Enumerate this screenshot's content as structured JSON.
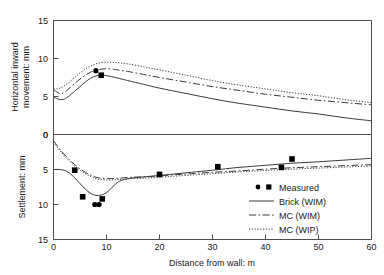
{
  "chart_data": {
    "type": "line",
    "title": "",
    "xlabel": "Distance from wall: m",
    "xlim": [
      0,
      60
    ],
    "xticks": [
      0,
      10,
      20,
      30,
      40,
      50,
      60
    ],
    "grid": false,
    "legend_position": "inside-bottom-right",
    "panels": [
      {
        "id": "top",
        "ylabel": "Horizontal inward movement: mm",
        "ylim": [
          0,
          15
        ],
        "yticks": [
          0,
          5,
          10,
          15
        ],
        "y_inverted": false,
        "series": [
          {
            "name": "Brick (WIM)",
            "style": "solid",
            "x": [
              0,
              0.6,
              1.2,
              2.0,
              3.0,
              4.0,
              5.0,
              6.0,
              7.0,
              8.0,
              9.0,
              10.0,
              11.0,
              12.0,
              14.0,
              17.0,
              20.0,
              25.0,
              30.0,
              35.0,
              40.0,
              45.0,
              50.0,
              55.0,
              60.0
            ],
            "y": [
              4.9,
              4.75,
              4.6,
              4.65,
              5.1,
              5.7,
              6.3,
              6.9,
              7.4,
              7.7,
              7.8,
              7.75,
              7.6,
              7.45,
              7.1,
              6.6,
              6.1,
              5.4,
              4.7,
              4.1,
              3.6,
              3.1,
              2.7,
              2.2,
              1.8
            ]
          },
          {
            "name": "MC (WIM)",
            "style": "dash-dot",
            "x": [
              0,
              0.6,
              1.2,
              2.0,
              3.0,
              4.0,
              5.0,
              6.0,
              7.0,
              8.0,
              9.0,
              10.0,
              11.0,
              12.0,
              14.0,
              17.0,
              20.0,
              25.0,
              30.0,
              35.0,
              40.0,
              45.0,
              50.0,
              55.0,
              60.0
            ],
            "y": [
              5.9,
              5.6,
              5.4,
              5.5,
              6.1,
              6.7,
              7.3,
              7.8,
              8.2,
              8.45,
              8.6,
              8.65,
              8.6,
              8.5,
              8.3,
              7.9,
              7.5,
              6.9,
              6.3,
              5.8,
              5.3,
              4.9,
              4.5,
              4.2,
              3.9
            ]
          },
          {
            "name": "MC (WIP)",
            "style": "dotted",
            "x": [
              0,
              0.6,
              1.2,
              2.0,
              3.0,
              4.0,
              5.0,
              6.0,
              7.0,
              8.0,
              9.0,
              10.0,
              11.0,
              12.0,
              14.0,
              17.0,
              20.0,
              25.0,
              30.0,
              35.0,
              40.0,
              45.0,
              50.0,
              55.0,
              60.0
            ],
            "y": [
              6.0,
              6.0,
              6.1,
              6.4,
              6.9,
              7.5,
              8.1,
              8.6,
              9.0,
              9.3,
              9.45,
              9.5,
              9.5,
              9.45,
              9.3,
              8.9,
              8.5,
              7.8,
              7.1,
              6.5,
              6.0,
              5.5,
              5.1,
              4.6,
              4.2
            ]
          },
          {
            "name": "Measured",
            "style": "markers",
            "points": [
              {
                "x": 8.0,
                "y": 8.4,
                "marker": "circle"
              },
              {
                "x": 9.0,
                "y": 7.8,
                "marker": "square"
              }
            ]
          }
        ]
      },
      {
        "id": "bottom",
        "ylabel": "Settlement: mm",
        "ylim": [
          0,
          15
        ],
        "yticks": [
          0,
          5,
          10,
          15
        ],
        "y_inverted": true,
        "series": [
          {
            "name": "Brick (WIM)",
            "style": "solid",
            "x": [
              0,
              1.0,
              2.0,
              3.0,
              4.0,
              5.0,
              6.0,
              7.0,
              8.0,
              9.0,
              10.0,
              11.0,
              12.0,
              13.0,
              15.0,
              18.0,
              22.0,
              26.0,
              30.0,
              35.0,
              40.0,
              45.0,
              50.0,
              55.0,
              60.0
            ],
            "y": [
              5.0,
              5.0,
              5.1,
              5.5,
              6.2,
              7.0,
              7.8,
              8.4,
              8.7,
              8.65,
              8.3,
              7.6,
              6.9,
              6.5,
              6.2,
              6.0,
              5.7,
              5.4,
              5.1,
              4.7,
              4.4,
              4.1,
              3.9,
              3.65,
              3.4
            ]
          },
          {
            "name": "MC (WIM)",
            "style": "dash-dot",
            "x": [
              0,
              1.0,
              2.0,
              3.0,
              4.0,
              5.0,
              6.0,
              7.0,
              8.0,
              9.0,
              10.0,
              11.0,
              12.0,
              13.0,
              15.0,
              18.0,
              22.0,
              26.0,
              30.0,
              35.0,
              40.0,
              45.0,
              50.0,
              55.0,
              60.0
            ],
            "y": [
              0.9,
              1.9,
              2.8,
              3.6,
              4.3,
              4.9,
              5.4,
              5.8,
              6.1,
              6.25,
              6.3,
              6.3,
              6.25,
              6.2,
              6.1,
              6.0,
              5.8,
              5.6,
              5.4,
              5.2,
              4.95,
              4.75,
              4.6,
              4.45,
              4.3
            ]
          },
          {
            "name": "MC (WIP)",
            "style": "dotted",
            "x": [
              0,
              1.0,
              2.0,
              3.0,
              4.0,
              5.0,
              6.0,
              7.0,
              8.0,
              9.0,
              10.0,
              11.0,
              12.0,
              13.0,
              15.0,
              18.0,
              22.0,
              26.0,
              30.0,
              35.0,
              40.0,
              45.0,
              50.0,
              55.0,
              60.0
            ],
            "y": [
              1.1,
              2.1,
              3.0,
              3.8,
              4.5,
              5.1,
              5.6,
              6.0,
              6.3,
              6.45,
              6.5,
              6.5,
              6.45,
              6.4,
              6.3,
              6.2,
              6.0,
              5.8,
              5.6,
              5.35,
              5.15,
              4.95,
              4.8,
              4.65,
              4.5
            ]
          },
          {
            "name": "Measured",
            "style": "markers",
            "points": [
              {
                "x": 4.0,
                "y": 5.1,
                "marker": "square"
              },
              {
                "x": 5.5,
                "y": 8.9,
                "marker": "square"
              },
              {
                "x": 7.8,
                "y": 10.0,
                "marker": "circle"
              },
              {
                "x": 8.6,
                "y": 10.0,
                "marker": "circle"
              },
              {
                "x": 9.2,
                "y": 9.2,
                "marker": "square"
              },
              {
                "x": 20.0,
                "y": 5.7,
                "marker": "square"
              },
              {
                "x": 31.0,
                "y": 4.6,
                "marker": "square"
              },
              {
                "x": 43.0,
                "y": 4.7,
                "marker": "square"
              },
              {
                "x": 45.0,
                "y": 3.5,
                "marker": "square"
              }
            ]
          }
        ]
      }
    ],
    "legend": [
      {
        "label": "Measured",
        "style": "markers"
      },
      {
        "label": "Brick (WIM)",
        "style": "solid"
      },
      {
        "label": "MC (WIM)",
        "style": "dash-dot"
      },
      {
        "label": "MC (WIP)",
        "style": "dotted"
      }
    ]
  },
  "axes": {
    "x_label": "Distance from wall: m",
    "x_tick_labels": [
      "0",
      "10",
      "20",
      "30",
      "40",
      "50",
      "60"
    ],
    "top_y_label_line1": "Horizontal inward",
    "top_y_label_line2": "movement: mm",
    "top_y_tick_labels": [
      "15",
      "10",
      "5",
      "0"
    ],
    "bottom_y_label": "Settlement: mm",
    "bottom_y_tick_labels": [
      "0",
      "5",
      "10",
      "15"
    ]
  },
  "legend_labels": {
    "measured": "Measured",
    "brick_wim": "Brick (WIM)",
    "mc_wim": "MC (WIM)",
    "mc_wip": "MC (WIP)"
  },
  "colors": {
    "line": "#3b3b3b",
    "axis": "#4d4d4d",
    "marker": "#000000",
    "text": "#1a1a1a",
    "background": "#ffffff"
  }
}
